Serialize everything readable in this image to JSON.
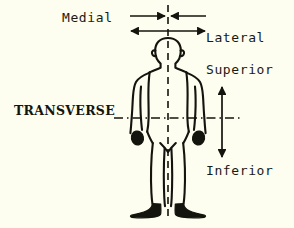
{
  "diagram": {
    "figure": "human-body-anterior-view",
    "background_color": "#fdfdf0",
    "ink_color": "#14140e",
    "labels": {
      "medial": "Medial",
      "lateral": "Lateral",
      "superior": "Superior",
      "inferior": "Inferior",
      "transverse": "TRANSVERSE"
    },
    "reference_lines": [
      {
        "name": "midsagittal-midline",
        "orientation": "vertical",
        "style": "dashed",
        "x": 168,
        "y_start": 5,
        "y_end": 221
      },
      {
        "name": "transverse-plane-line",
        "orientation": "horizontal",
        "style": "dash-dot",
        "y": 118,
        "x_start": 114,
        "x_end": 241
      }
    ],
    "arrows": [
      {
        "name": "medial-arrows",
        "direction": "inward-toward-midline",
        "orientation": "horizontal",
        "y": 16,
        "x_start": 130,
        "x_end": 206,
        "heads": "both-inward"
      },
      {
        "name": "lateral-arrow",
        "direction": "outward-from-midline",
        "orientation": "horizontal",
        "y": 31,
        "x_start": 130,
        "x_end": 206,
        "heads": "both-outward"
      },
      {
        "name": "superior-inferior-arrow",
        "direction": "vertical-bidirectional",
        "orientation": "vertical",
        "x": 222,
        "y_start": 86,
        "y_end": 158,
        "heads": "both"
      }
    ]
  }
}
